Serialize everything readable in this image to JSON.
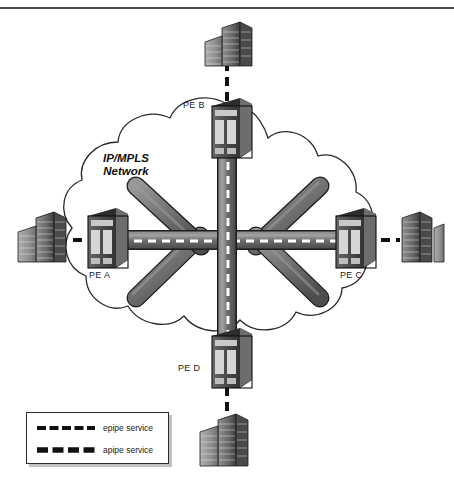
{
  "diagram": {
    "cloud_label_line1": "IP/MPLS",
    "cloud_label_line2": "Network",
    "colors": {
      "pipe_fill": "#6e6e6e",
      "pipe_stroke": "#1c1c1c",
      "pipe_highlight": "#8f8f8f",
      "cloud_stroke": "#2a2a2a",
      "dash_white": "#ffffff",
      "dash_black": "#111111",
      "border": "#4a4a4a",
      "router_body": "#4f4f4f",
      "building_fill": "#8a8a8a"
    }
  },
  "nodes": [
    {
      "id": "pe-b",
      "label": "PE B",
      "role": "provider-edge-router",
      "x": 227,
      "y": 130,
      "label_x": 186,
      "label_y": 105
    },
    {
      "id": "pe-a",
      "label": "PE A",
      "role": "provider-edge-router",
      "x": 104,
      "y": 240,
      "label_x": 92,
      "label_y": 272
    },
    {
      "id": "pe-c",
      "label": "PE C",
      "role": "provider-edge-router",
      "x": 352,
      "y": 240,
      "label_x": 340,
      "label_y": 272
    },
    {
      "id": "pe-d",
      "label": "PE D",
      "role": "provider-edge-router",
      "x": 227,
      "y": 360,
      "label_x": 180,
      "label_y": 368
    }
  ],
  "customer_sites": [
    {
      "id": "ce-top",
      "position": "top",
      "x": 227,
      "y": 48
    },
    {
      "id": "ce-left",
      "position": "left",
      "x": 40,
      "y": 238
    },
    {
      "id": "ce-right",
      "position": "right",
      "x": 415,
      "y": 238
    },
    {
      "id": "ce-bottom",
      "position": "bottom",
      "x": 227,
      "y": 440
    }
  ],
  "pipes": [
    {
      "id": "pipe-horizontal",
      "from": "pe-a",
      "to": "pe-c",
      "orientation": "horizontal",
      "service": "epipe service"
    },
    {
      "id": "pipe-vertical",
      "from": "pe-b",
      "to": "pe-d",
      "orientation": "vertical",
      "service": "apipe service"
    },
    {
      "id": "pipe-pea-peb",
      "from": "pe-a",
      "to": "pe-b",
      "orientation": "diagonal",
      "service": ""
    },
    {
      "id": "pipe-peb-pec",
      "from": "pe-b",
      "to": "pe-c",
      "orientation": "diagonal",
      "service": ""
    },
    {
      "id": "pipe-pea-ped",
      "from": "pe-a",
      "to": "pe-d",
      "orientation": "diagonal",
      "service": ""
    },
    {
      "id": "pipe-ped-pec",
      "from": "pe-d",
      "to": "pe-c",
      "orientation": "diagonal",
      "service": ""
    }
  ],
  "legend": {
    "items": [
      {
        "id": "legend-epipe",
        "label": "epipe service",
        "style": "thin-dash"
      },
      {
        "id": "legend-apipe",
        "label": "apipe service",
        "style": "thick-dash"
      }
    ]
  }
}
